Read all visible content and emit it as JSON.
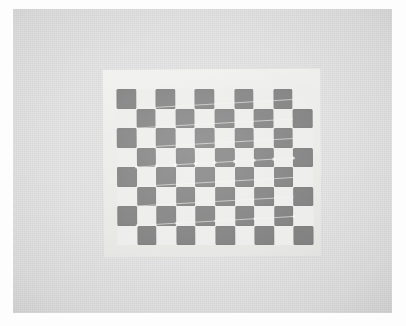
{
  "image": {
    "kind": "photograph",
    "subject": "camera-calibration-checkerboard",
    "width": 406,
    "height": 326,
    "caption": ""
  },
  "colors": {
    "page_background": "#ffffff",
    "photo_background": "#dfe0df",
    "paper_sheet": "#e7e7e4",
    "square_dark": "#6f6f6f",
    "square_light": "#ececea",
    "detection_line": "#f2f2ee",
    "corner_marker": "#ffffff"
  },
  "photo": {
    "left": 13,
    "top": 9,
    "width": 379,
    "height": 304
  },
  "paper_sheet": {
    "left": 90,
    "top": 60,
    "width": 218,
    "height": 188,
    "rotation_deg": -0.35
  },
  "checkerboard": {
    "left": 104,
    "top": 80,
    "width": 196,
    "height": 156,
    "columns": 10,
    "rows": 8,
    "inner_corners_x": 9,
    "inner_corners_y": 7,
    "rotation_deg": -0.4,
    "top_left_is_dark": true,
    "pattern": [
      [
        1,
        0,
        1,
        0,
        1,
        0,
        1,
        0,
        1,
        0
      ],
      [
        0,
        1,
        0,
        1,
        0,
        1,
        0,
        1,
        0,
        1
      ],
      [
        1,
        0,
        1,
        0,
        1,
        0,
        1,
        0,
        1,
        0
      ],
      [
        0,
        1,
        0,
        1,
        0,
        1,
        0,
        1,
        0,
        1
      ],
      [
        1,
        0,
        1,
        0,
        1,
        0,
        1,
        0,
        1,
        0
      ],
      [
        0,
        1,
        0,
        1,
        0,
        1,
        0,
        1,
        0,
        1
      ],
      [
        1,
        0,
        1,
        0,
        1,
        0,
        1,
        0,
        1,
        0
      ],
      [
        0,
        1,
        0,
        1,
        0,
        1,
        0,
        1,
        0,
        1
      ]
    ]
  },
  "detection_overlay": {
    "visible": true,
    "line_color": "#f2f2ee",
    "line_width": 0.8,
    "marker_color": "#ffffff",
    "marker_radius": 1.6,
    "rows": 7,
    "cols": 9,
    "row_slope_px": -9,
    "note": "drawChessboardCorners polyline with circular corner markers"
  }
}
